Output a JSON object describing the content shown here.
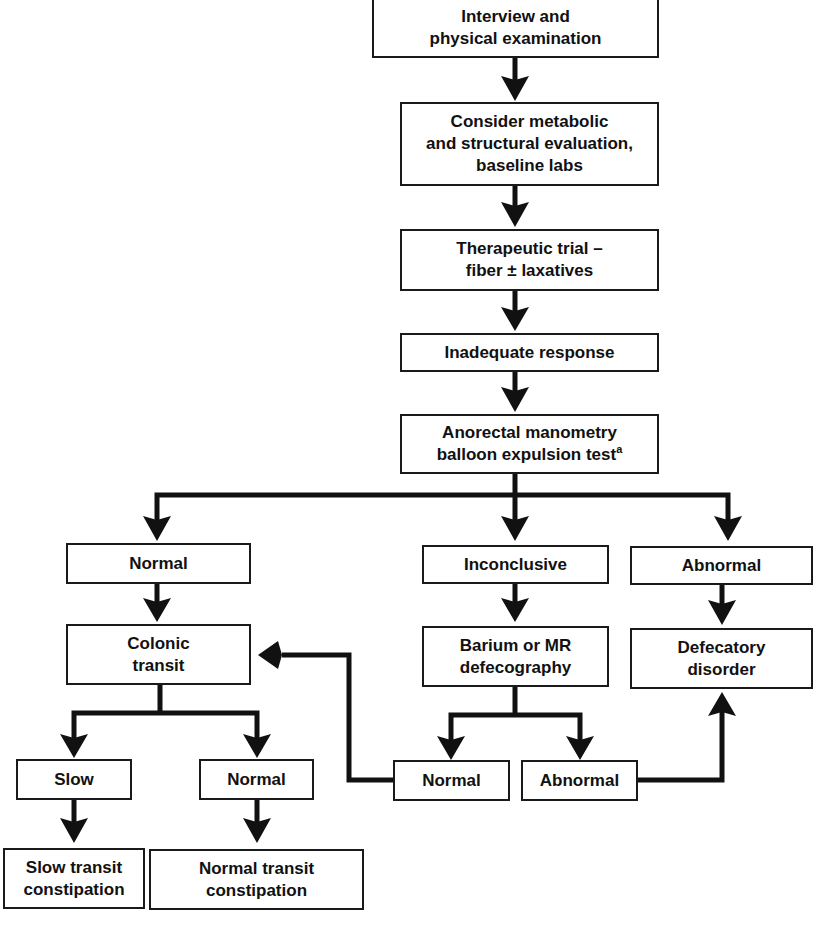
{
  "diagram": {
    "type": "flowchart",
    "colors": {
      "stroke": "#1a1a1a",
      "text": "#111111",
      "background": "#ffffff"
    },
    "nodes": {
      "interview": {
        "label": "Interview and\nphysical examination"
      },
      "metabolic": {
        "label": "Consider metabolic\nand structural evaluation,\nbaseline labs"
      },
      "therapeutic": {
        "label": "Therapeutic trial –\nfiber ± laxatives"
      },
      "inadequate": {
        "label": "Inadequate response"
      },
      "manometry": {
        "label": "Anorectal manometry\nballoon expulsion test",
        "footnote": "a"
      },
      "result_normal": {
        "label": "Normal"
      },
      "result_inconclusive": {
        "label": "Inconclusive"
      },
      "result_abnormal": {
        "label": "Abnormal"
      },
      "colonic_transit": {
        "label": "Colonic\ntransit"
      },
      "defecography": {
        "label": "Barium or MR\ndefecography"
      },
      "defecatory_disorder": {
        "label": "Defecatory\ndisorder"
      },
      "transit_slow": {
        "label": "Slow"
      },
      "transit_normal": {
        "label": "Normal"
      },
      "defeco_normal": {
        "label": "Normal"
      },
      "defeco_abnormal": {
        "label": "Abnormal"
      },
      "slow_transit_constipation": {
        "label": "Slow transit\nconstipation"
      },
      "normal_transit_constipation": {
        "label": "Normal transit\nconstipation"
      }
    },
    "edges": [
      {
        "from": "interview",
        "to": "metabolic"
      },
      {
        "from": "metabolic",
        "to": "therapeutic"
      },
      {
        "from": "therapeutic",
        "to": "inadequate"
      },
      {
        "from": "inadequate",
        "to": "manometry"
      },
      {
        "from": "manometry",
        "to": "result_normal"
      },
      {
        "from": "manometry",
        "to": "result_inconclusive"
      },
      {
        "from": "manometry",
        "to": "result_abnormal"
      },
      {
        "from": "result_normal",
        "to": "colonic_transit"
      },
      {
        "from": "result_inconclusive",
        "to": "defecography"
      },
      {
        "from": "result_abnormal",
        "to": "defecatory_disorder"
      },
      {
        "from": "colonic_transit",
        "to": "transit_slow"
      },
      {
        "from": "colonic_transit",
        "to": "transit_normal"
      },
      {
        "from": "defecography",
        "to": "defeco_normal"
      },
      {
        "from": "defecography",
        "to": "defeco_abnormal"
      },
      {
        "from": "defeco_normal",
        "to": "colonic_transit"
      },
      {
        "from": "defeco_abnormal",
        "to": "defecatory_disorder"
      },
      {
        "from": "transit_slow",
        "to": "slow_transit_constipation"
      },
      {
        "from": "transit_normal",
        "to": "normal_transit_constipation"
      }
    ]
  }
}
